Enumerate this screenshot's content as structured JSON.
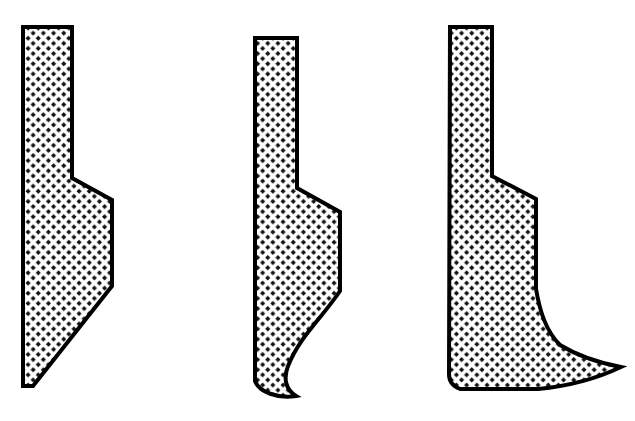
{
  "figure": {
    "background_color": "#ffffff",
    "outline_color": "#000000",
    "hatch_dot_color": "#111111",
    "hatch_fill_color": "#ffffff",
    "outline_width": 4,
    "hatch": {
      "name": "dotted-diamond-grid",
      "cell_size": 10.2,
      "dot_radius": 2.6,
      "description": "dense staggered grid of dark diamond dots"
    },
    "canvas": {
      "width": 635,
      "height": 421
    },
    "shapes": [
      {
        "id": "profile-left",
        "label": "Profile A",
        "description": "Straight tapered blade: narrow vertical shank, single step, long straight diagonal to a sharp bottom point",
        "path": "M 23 27 L 72 27 L 72 178 L 112 200 L 112 286 L 33 386 L 23 386 Z",
        "bbox": {
          "x": 23,
          "y": 27,
          "width": 89,
          "height": 359
        }
      },
      {
        "id": "profile-middle",
        "label": "Profile B",
        "description": "Concave blade: narrow vertical shank, single step, straight flank then concave curve hooking to a bottom point",
        "path": "M 255 38 L 297 38 L 297 188 L 340 212 L 340 291 C 322 318 300 336 288 366 C 283 379 286 390 296 396 C 278 399 259 392 255 381 Z",
        "bbox": {
          "x": 255,
          "y": 38,
          "width": 85,
          "height": 361
        }
      },
      {
        "id": "profile-right",
        "label": "Profile C",
        "description": "Flared-foot blade: narrow vertical shank, single step, concave waist flaring out to a broad pointed foot with flat base",
        "path": "M 450 27 L 492 27 L 492 176 L 536 199 L 536 289 C 540 312 546 331 560 345 C 578 356 600 363 621 367 C 598 378 570 386 538 389 L 460 389 C 452 386 449 381 449 374 Z",
        "bbox": {
          "x": 449,
          "y": 27,
          "width": 172,
          "height": 362
        }
      }
    ]
  }
}
